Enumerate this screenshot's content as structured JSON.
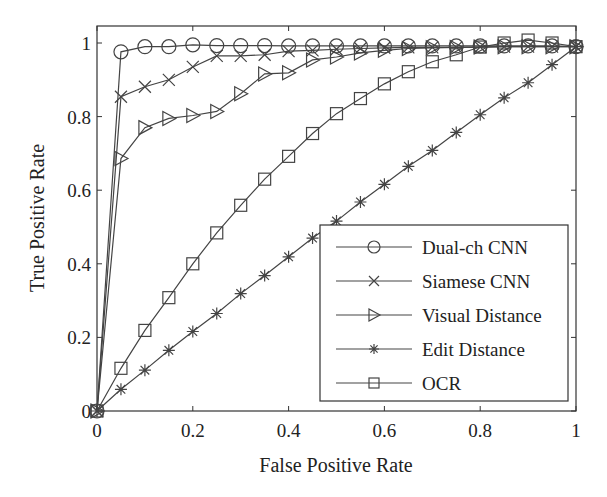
{
  "chart_data": {
    "type": "line",
    "title": "",
    "xlabel": "False Positive Rate",
    "ylabel": "True Positive Rate",
    "xlim": [
      0,
      1
    ],
    "ylim": [
      0,
      1.04
    ],
    "grid": false,
    "legend_position": "lower right",
    "x_ticks": [
      "0",
      "0.2",
      "0.4",
      "0.6",
      "0.8",
      "1"
    ],
    "y_ticks": [
      "0",
      "0.2",
      "0.4",
      "0.6",
      "0.8",
      "1"
    ],
    "x": [
      0,
      0.05,
      0.1,
      0.15,
      0.2,
      0.25,
      0.3,
      0.35,
      0.4,
      0.45,
      0.5,
      0.55,
      0.6,
      0.65,
      0.7,
      0.75,
      0.8,
      0.85,
      0.9,
      0.95,
      1.0
    ],
    "series": [
      {
        "name": "Dual-ch CNN",
        "marker": "circle",
        "values": [
          0,
          0.976,
          0.99,
          0.99,
          0.995,
          0.993,
          0.993,
          0.993,
          0.992,
          0.992,
          0.992,
          0.992,
          0.992,
          0.992,
          0.992,
          0.992,
          0.992,
          0.992,
          0.992,
          0.992,
          0.99
        ]
      },
      {
        "name": "Siamese CNN",
        "marker": "x",
        "values": [
          0,
          0.854,
          0.881,
          0.9,
          0.935,
          0.965,
          0.965,
          0.968,
          0.978,
          0.98,
          0.983,
          0.985,
          0.987,
          0.988,
          0.988,
          0.988,
          0.989,
          0.99,
          0.99,
          0.99,
          0.99
        ]
      },
      {
        "name": "Visual Distance",
        "marker": "triangle-right",
        "values": [
          0,
          0.686,
          0.77,
          0.795,
          0.803,
          0.814,
          0.862,
          0.916,
          0.919,
          0.954,
          0.962,
          0.973,
          0.98,
          0.985,
          0.987,
          0.988,
          0.989,
          0.99,
          0.99,
          0.99,
          0.99
        ]
      },
      {
        "name": "Edit Distance",
        "marker": "star",
        "values": [
          0,
          0.059,
          0.111,
          0.165,
          0.216,
          0.265,
          0.319,
          0.368,
          0.419,
          0.47,
          0.516,
          0.568,
          0.616,
          0.665,
          0.708,
          0.757,
          0.805,
          0.851,
          0.892,
          0.941,
          0.99
        ]
      },
      {
        "name": "OCR",
        "marker": "square",
        "values": [
          0,
          0.116,
          0.219,
          0.308,
          0.4,
          0.484,
          0.559,
          0.63,
          0.692,
          0.754,
          0.808,
          0.849,
          0.889,
          0.922,
          0.949,
          0.968,
          0.989,
          1.0,
          1.008,
          1.0,
          0.99
        ]
      }
    ]
  },
  "colors": {
    "line": "#444444",
    "axis": "#333333",
    "background": "#ffffff"
  }
}
